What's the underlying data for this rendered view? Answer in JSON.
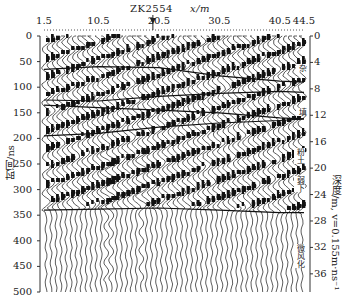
{
  "chart_data": {
    "type": "wiggle-trace radar profile",
    "title": "ZK2554",
    "borehole_marker": {
      "label": "ZK2554",
      "x_m": 20.5
    },
    "xlabel": "x/m",
    "x_ticks": [
      "1.5",
      "10.5",
      "20.5",
      "30.5",
      "40.5",
      "44.5"
    ],
    "xlim": [
      1.5,
      44.5
    ],
    "ylabel_left": "时间/ns",
    "y_ticks_left": [
      "0",
      "50",
      "100",
      "150",
      "200",
      "250",
      "300",
      "350",
      "400",
      "450",
      "500"
    ],
    "ylim_left": [
      0,
      500
    ],
    "ylabel_right": "深度/m, v=0.155m·ns⁻¹",
    "y_ticks_right": [
      "0",
      "4",
      "8",
      "12",
      "16",
      "20",
      "24",
      "28",
      "32",
      "36"
    ],
    "ylim_right": [
      0,
      38.75
    ],
    "interfaces": [
      {
        "name": "interface-1",
        "points_x_m": [
          1.5,
          10.5,
          20.5,
          30.5,
          40.5,
          44.5
        ],
        "points_t_ns": [
          65,
          60,
          62,
          78,
          88,
          90
        ]
      },
      {
        "name": "interface-2",
        "points_x_m": [
          1.5,
          10.5,
          20.5,
          30.5,
          40.5,
          44.5
        ],
        "points_t_ns": [
          125,
          127,
          118,
          112,
          108,
          110
        ]
      },
      {
        "name": "interface-3",
        "points_x_m": [
          1.5,
          10.5,
          20.5,
          30.5,
          40.5,
          44.5
        ],
        "points_t_ns": [
          135,
          140,
          145,
          150,
          160,
          162
        ]
      },
      {
        "name": "interface-4",
        "points_x_m": [
          1.5,
          10.5,
          20.5,
          30.5,
          40.5,
          44.5
        ],
        "points_t_ns": [
          195,
          190,
          178,
          170,
          165,
          162
        ]
      },
      {
        "name": "interface-5",
        "points_x_m": [
          1.5,
          10.5,
          20.5,
          30.5,
          40.5,
          44.5
        ],
        "points_t_ns": [
          340,
          338,
          336,
          340,
          345,
          345
        ]
      }
    ],
    "layer_annotations": [
      "杂",
      "填",
      "粉土",
      "弱下",
      "微风化"
    ],
    "grid": false,
    "legend": "none"
  },
  "labels": {
    "title": "ZK2554",
    "xunit": "x/m",
    "left_axis": "时间/ns",
    "right_axis": "深度/m, v=0.155m·ns⁻¹"
  }
}
